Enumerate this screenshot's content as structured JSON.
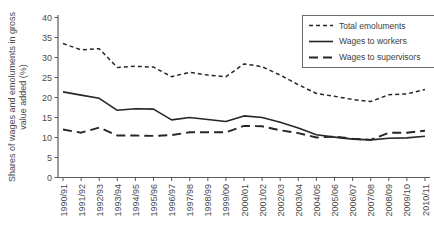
{
  "figure": {
    "background": "#ffffff",
    "line_color": "#262626",
    "axis_color": "#5a5a5a",
    "text_color": "#4a4a4a"
  },
  "chart_data": {
    "type": "line",
    "title": "",
    "xlabel": "",
    "ylabel": "Shares of wages and emoluments in gross value added (%)",
    "ylim": [
      0,
      40
    ],
    "ytick_step": 5,
    "yticks": [
      0,
      5,
      10,
      15,
      20,
      25,
      30,
      35,
      40
    ],
    "grid": false,
    "legend_position": "top-right",
    "categories": [
      "1990/91",
      "1991/92",
      "1992/93",
      "1993/94",
      "1994/95",
      "1995/96",
      "1996/97",
      "1997/98",
      "1998/99",
      "1999/00",
      "2000/01",
      "2001/02",
      "2002/03",
      "2003/04",
      "2004/05",
      "2005/06",
      "2006/07",
      "2007/08",
      "2008/09",
      "2009/10",
      "2010/11"
    ],
    "series": [
      {
        "name": "Total emoluments",
        "line_style": "dashed-short",
        "values": [
          33.5,
          31.9,
          32.2,
          27.5,
          27.8,
          27.6,
          25.2,
          26.3,
          25.6,
          25.2,
          28.4,
          27.7,
          25.6,
          23.2,
          21.0,
          20.3,
          19.5,
          19.0,
          20.7,
          20.9,
          22.0
        ]
      },
      {
        "name": "Wages to workers",
        "line_style": "solid",
        "values": [
          21.4,
          20.6,
          19.8,
          16.8,
          17.2,
          17.1,
          14.4,
          15.0,
          14.5,
          14.0,
          15.4,
          15.0,
          13.8,
          12.4,
          10.7,
          10.1,
          9.6,
          9.4,
          9.8,
          9.9,
          10.3
        ]
      },
      {
        "name": "Wages to supervisors",
        "line_style": "dashed-long",
        "values": [
          12.0,
          11.2,
          12.5,
          10.5,
          10.5,
          10.4,
          10.6,
          11.3,
          11.3,
          11.3,
          12.9,
          12.8,
          11.8,
          11.1,
          10.0,
          10.2,
          9.7,
          9.4,
          11.2,
          11.2,
          11.7
        ]
      }
    ]
  }
}
